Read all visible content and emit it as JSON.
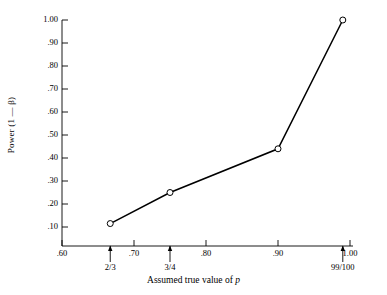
{
  "chart_data": {
    "type": "line",
    "title": "",
    "xlabel": "Assumed true value of p",
    "ylabel": "Power (1 — β)",
    "xlim": [
      0.6,
      1.0
    ],
    "ylim": [
      0.0,
      1.0
    ],
    "grid": false,
    "legend": "none",
    "marker": "open-circle",
    "line_color": "#000000",
    "x": [
      0.667,
      0.75,
      0.9,
      0.99
    ],
    "values": [
      0.115,
      0.25,
      0.44,
      1.0
    ],
    "point_labels": [
      "2/3",
      "3/4",
      ".90",
      "99/100"
    ],
    "xticks": [
      {
        "value": 0.6,
        "label": ".60"
      },
      {
        "value": 0.7,
        "label": ".70"
      },
      {
        "value": 0.8,
        "label": ".80"
      },
      {
        "value": 0.9,
        "label": ".90"
      },
      {
        "value": 1.0,
        "label": "1.00"
      }
    ],
    "yticks": [
      {
        "value": 0.1,
        "label": ".10"
      },
      {
        "value": 0.2,
        "label": ".20"
      },
      {
        "value": 0.3,
        "label": ".30"
      },
      {
        "value": 0.4,
        "label": ".40"
      },
      {
        "value": 0.5,
        "label": ".50"
      },
      {
        "value": 0.6,
        "label": ".60"
      },
      {
        "value": 0.7,
        "label": ".70"
      },
      {
        "value": 0.8,
        "label": ".80"
      },
      {
        "value": 0.9,
        "label": ".90"
      },
      {
        "value": 1.0,
        "label": "1.00"
      }
    ],
    "annotations": [
      {
        "name": "arrow-two-thirds",
        "x": 0.667,
        "label": "2/3"
      },
      {
        "name": "arrow-three-quarters",
        "x": 0.75,
        "label": "3/4"
      },
      {
        "name": "arrow-ninety-nine-hundredths",
        "x": 0.99,
        "label": "99/100"
      }
    ]
  },
  "axis": {
    "ylabel_text": "Power (1 — β)",
    "xlabel_prefix": "Assumed true value of ",
    "xlabel_italic": "p"
  }
}
